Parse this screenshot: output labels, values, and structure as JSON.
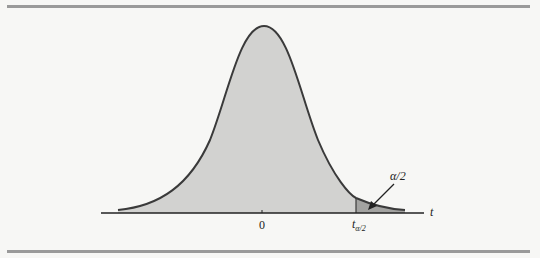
{
  "figure": {
    "type": "t-distribution-upper-tail",
    "labels": {
      "center_tick": "0",
      "axis_variable": "t",
      "critical_value_main": "t",
      "critical_value_sub": "α/2",
      "tail_area": "α/2"
    },
    "colors": {
      "curve_fill": "#d2d2d0",
      "tail_fill": "#a3a3a1",
      "curve_stroke": "#3a3a3a",
      "background": "#f7f7f5",
      "rule": "#9a9a9a"
    }
  }
}
